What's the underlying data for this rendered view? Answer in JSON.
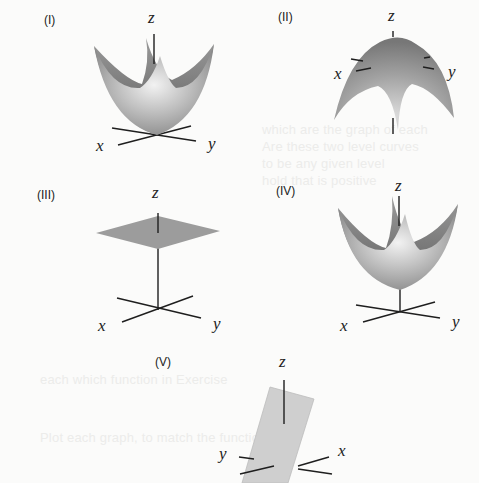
{
  "figure": {
    "panels": [
      {
        "id": "I",
        "label": "(I)",
        "surface": "upward paraboloid, vertex at origin",
        "axes": {
          "x": "x",
          "y": "y",
          "z": "z"
        }
      },
      {
        "id": "II",
        "label": "(II)",
        "surface": "downward paraboloid (cap opening down)",
        "axes": {
          "x": "x",
          "y": "y",
          "z": "z"
        }
      },
      {
        "id": "III",
        "label": "(III)",
        "surface": "horizontal plane above origin",
        "axes": {
          "x": "x",
          "y": "y",
          "z": "z"
        }
      },
      {
        "id": "IV",
        "label": "(IV)",
        "surface": "upward paraboloid, vertex raised above origin",
        "axes": {
          "x": "x",
          "y": "y",
          "z": "z"
        }
      },
      {
        "id": "V",
        "label": "(V)",
        "surface": "tilted plane through origin",
        "axes": {
          "x": "x",
          "y": "y",
          "z": "z"
        }
      }
    ]
  },
  "colors": {
    "surface_light": "#d8d8d8",
    "surface_mid": "#a9a9a9",
    "surface_dark": "#6f6f6f",
    "plane": "#9a9a9a",
    "tilted_plane": "#cfcfcf",
    "axis": "#1e1e1e"
  }
}
